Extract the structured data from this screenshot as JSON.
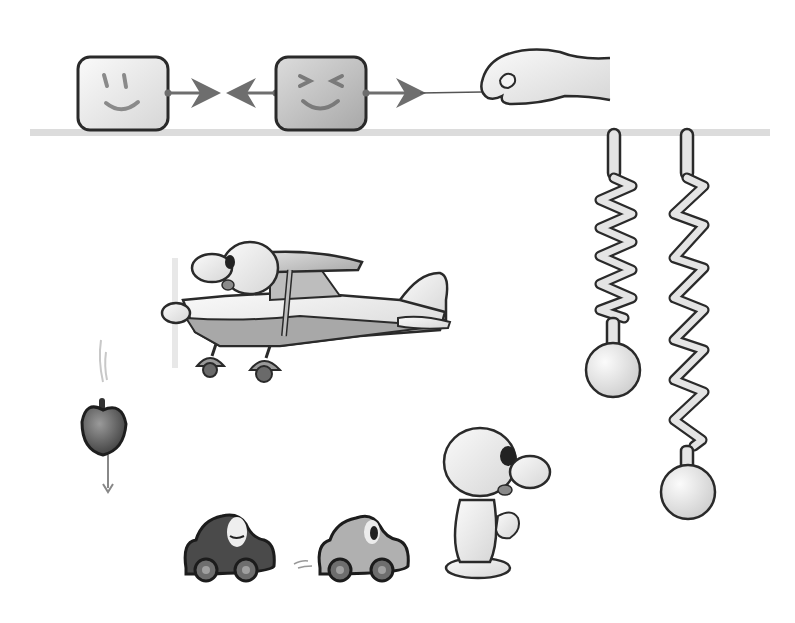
{
  "illustration": {
    "title": "",
    "colors": {
      "outline": "#2a2a2a",
      "light_fill": "#e6e6e6",
      "mid_fill": "#b4b4b4",
      "dark_fill": "#5a5a5a",
      "shelf": "#d8d8d8",
      "arrow": "#6e6e6e",
      "background": "#ffffff"
    },
    "scenes": [
      {
        "id": "force-pair",
        "description": "Two square faces connected by opposite arrows, a hand pulling a string"
      },
      {
        "id": "springs",
        "description": "Two springs hanging from a ceiling bar with balls; one compressed, one stretched"
      },
      {
        "id": "airplane",
        "description": "Cartoon character flying a small propeller plane"
      },
      {
        "id": "falling-apple",
        "description": "Apple falling with a downward arrow"
      },
      {
        "id": "cars",
        "description": "Dark car and light car moving, with motion lines"
      },
      {
        "id": "character",
        "description": "Cartoon character watching the cars"
      }
    ]
  }
}
